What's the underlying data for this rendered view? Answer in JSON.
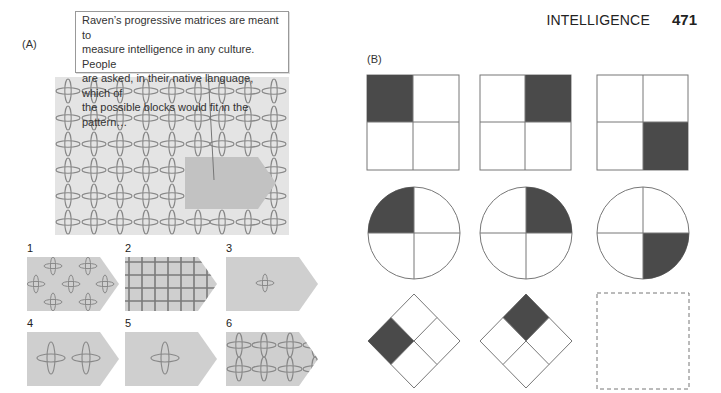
{
  "header": {
    "section": "INTELLIGENCE",
    "page_number": "471"
  },
  "panel_a": {
    "label": "(A)",
    "caption": "Raven’s progressive matrices are meant to measure intelligence in any culture. People are asked, in their native language, which of the possible blocks would fit in the pattern…",
    "caption_lines": [
      "Raven’s progressive matrices are meant to",
      "measure intelligence in any culture. People",
      "are asked, in their native language, which of",
      "the possible blocks would fit in the pattern…"
    ],
    "pattern": {
      "columns": 9,
      "rows": 6,
      "background": "#e4e4e4",
      "motif": "ellipse-cross-lattice"
    },
    "missing_block_color": "#c2c2c2",
    "options": [
      {
        "number": "1",
        "pattern": "scattered single crosses"
      },
      {
        "number": "2",
        "pattern": "dense grid"
      },
      {
        "number": "3",
        "pattern": "single small cross"
      },
      {
        "number": "4",
        "pattern": "two crosses joined"
      },
      {
        "number": "5",
        "pattern": "single large cross"
      },
      {
        "number": "6",
        "pattern": "lattice of crosses (correct fit)"
      }
    ]
  },
  "panel_b": {
    "label": "(B)",
    "shade_color": "#4a4a4a",
    "rows": [
      {
        "shape": "square",
        "shaded_quadrants": [
          "top-left",
          "top-right",
          "bottom-right"
        ]
      },
      {
        "shape": "circle",
        "shaded_quadrants": [
          "top-left",
          "top-right",
          "bottom-right"
        ]
      },
      {
        "shape": "diamond",
        "shaded_quadrants": [
          "left",
          "top",
          "missing"
        ]
      }
    ],
    "missing_cell": "dashed-empty-square"
  }
}
